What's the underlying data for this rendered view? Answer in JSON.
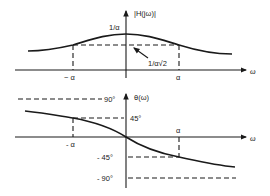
{
  "magnitude_plot": {
    "y_label": "|H(jω)|",
    "x_label": "ω",
    "peak_label": "1/α",
    "half_power_label": "1/α√2",
    "x_tick_neg": "− α",
    "x_tick_pos": "α"
  },
  "phase_plot": {
    "y_label": "θ(ω)",
    "x_label": "ω",
    "tick_90": "90°",
    "tick_45": "45°",
    "tick_neg45": "- 45°",
    "tick_neg90": "- 90°",
    "x_tick_neg": "- α",
    "x_tick_pos": "α"
  },
  "colors": {
    "ink": "#1a1a1a",
    "background": "#ffffff"
  }
}
